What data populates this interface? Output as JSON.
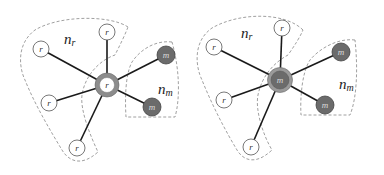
{
  "diagrams": [
    {
      "center": {
        "x": 107,
        "y": 85,
        "label": "r",
        "type": "r"
      },
      "r_nodes": [
        {
          "x": 107,
          "y": 32,
          "label": "r"
        },
        {
          "x": 41,
          "y": 49,
          "label": "r"
        },
        {
          "x": 49,
          "y": 103,
          "label": "r"
        },
        {
          "x": 77,
          "y": 148,
          "label": "r"
        }
      ],
      "m_nodes": [
        {
          "x": 166,
          "y": 55,
          "label": "m"
        },
        {
          "x": 152,
          "y": 107,
          "label": "m"
        }
      ],
      "region_labels": {
        "nr": {
          "text": "n",
          "sub": "r",
          "x": 64,
          "y": 44
        },
        "nm": {
          "text": "n",
          "sub": "m",
          "x": 158,
          "y": 94
        }
      }
    },
    {
      "center": {
        "x": 280,
        "y": 80,
        "label": "m",
        "type": "m"
      },
      "r_nodes": [
        {
          "x": 282,
          "y": 28,
          "label": "r"
        },
        {
          "x": 214,
          "y": 47,
          "label": "r"
        },
        {
          "x": 224,
          "y": 100,
          "label": "r"
        },
        {
          "x": 251,
          "y": 147,
          "label": "r"
        }
      ],
      "m_nodes": [
        {
          "x": 341,
          "y": 52,
          "label": "m"
        },
        {
          "x": 325,
          "y": 105,
          "label": "m"
        }
      ],
      "region_labels": {
        "nr": {
          "text": "n",
          "sub": "r",
          "x": 241,
          "y": 38
        },
        "nm": {
          "text": "n",
          "sub": "m",
          "x": 339,
          "y": 89
        }
      }
    }
  ],
  "colors": {
    "edge": "#1a1a1a",
    "node_stroke": "#555555",
    "m_fill": "#6b6b6b",
    "ring": "#8c8c8c",
    "dash": "#888888"
  }
}
